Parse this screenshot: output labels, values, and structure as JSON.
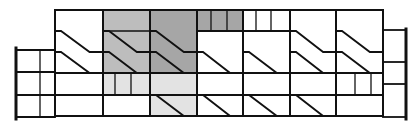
{
  "diagram": {
    "title": "",
    "width": 419,
    "height": 125,
    "colors": {
      "background": "#ffffff",
      "line": "#111111",
      "shade_dark": "#a6a6a6",
      "shade_mid": "#bdbdbd",
      "shade_light": "#e3e3e3"
    },
    "left_wing": {
      "x1": 16,
      "x2": 55,
      "inner_x": 40,
      "rows_y": [
        50,
        72,
        95,
        117
      ]
    },
    "right_wing": {
      "x1": 383,
      "x2": 406,
      "rows_y": [
        30,
        62,
        84,
        117
      ]
    },
    "main": {
      "columns_x": [
        55,
        103,
        150,
        197,
        243,
        290,
        336,
        383
      ],
      "rows_y": [
        10,
        31,
        52,
        73,
        95,
        116
      ]
    },
    "shaded_regions": [
      {
        "name": "shaded-cell-col2-upper",
        "x": 103,
        "y": 10,
        "w": 47,
        "h": 63,
        "shade": "shade_mid"
      },
      {
        "name": "shaded-cell-col3-upper",
        "x": 150,
        "y": 10,
        "w": 47,
        "h": 63,
        "shade": "shade_dark"
      },
      {
        "name": "shaded-cell-col4-top",
        "x": 197,
        "y": 10,
        "w": 46,
        "h": 21,
        "shade": "shade_dark"
      },
      {
        "name": "shaded-cell-col2-row4",
        "x": 103,
        "y": 73,
        "w": 47,
        "h": 22,
        "shade": "shade_light"
      },
      {
        "name": "shaded-cell-col3-lower",
        "x": 150,
        "y": 73,
        "w": 47,
        "h": 43,
        "shade": "shade_light"
      }
    ],
    "stairs": [
      {
        "col": 0,
        "y": 31
      },
      {
        "col": 0,
        "y": 52
      },
      {
        "col": 1,
        "y": 31
      },
      {
        "col": 1,
        "y": 52
      },
      {
        "col": 2,
        "y": 31
      },
      {
        "col": 2,
        "y": 52
      },
      {
        "col": 2,
        "y": 95
      },
      {
        "col": 3,
        "y": 52
      },
      {
        "col": 3,
        "y": 95
      },
      {
        "col": 4,
        "y": 52
      },
      {
        "col": 4,
        "y": 95
      },
      {
        "col": 5,
        "y": 31
      },
      {
        "col": 5,
        "y": 52
      },
      {
        "col": 5,
        "y": 95
      },
      {
        "col": 6,
        "y": 31
      },
      {
        "col": 6,
        "y": 52
      }
    ],
    "subdivisions": [
      {
        "x": 115,
        "y1": 73,
        "y2": 95
      },
      {
        "x": 131,
        "y1": 73,
        "y2": 95
      },
      {
        "x": 211,
        "y1": 10,
        "y2": 31
      },
      {
        "x": 227,
        "y1": 10,
        "y2": 31
      },
      {
        "x": 256,
        "y1": 10,
        "y2": 31
      },
      {
        "x": 271,
        "y1": 10,
        "y2": 31
      },
      {
        "x": 355,
        "y1": 73,
        "y2": 95
      },
      {
        "x": 371,
        "y1": 73,
        "y2": 95
      }
    ]
  }
}
